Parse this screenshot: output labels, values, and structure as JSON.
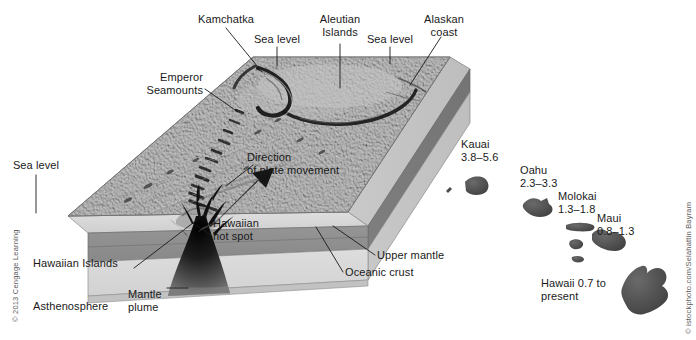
{
  "figure": {
    "background": "#ffffff"
  },
  "colors": {
    "seafloor_top": "#a9a9a9",
    "seafloor_top_light": "#bdbdbd",
    "crust_layer": "#d4d4d4",
    "upper_mantle_layer": "#8e8e8e",
    "asthenosphere_layer": "#d9d9d9",
    "plume": "#1a1a1a",
    "arrow": "#1c1c1c",
    "label_text": "#1a1a1a",
    "leader_line": "#1a1a1a",
    "island": "#4a4a4a",
    "credit_text": "#5b5b5b"
  },
  "labels": {
    "kamchatka": "Kamchatka",
    "sea_level_left_top": "Sea level",
    "aleutian_islands": "Aleutian\nIslands",
    "sea_level_right_top": "Sea level",
    "alaskan_coast": "Alaskan\ncoast",
    "emperor_seamounts": "Emperor\nSeamounts",
    "direction_of_plate_movement": "Direction\nof plate movement",
    "sea_level_left": "Sea level",
    "hawaiian_hot_spot": "Hawaiian\nhot spot",
    "hawaiian_islands": "Hawaiian Islands",
    "asthenosphere": "Asthenosphere",
    "mantle_plume": "Mantle\nplume",
    "upper_mantle": "Upper mantle",
    "oceanic_crust": "Oceanic crust"
  },
  "islands": [
    {
      "name": "Kauai",
      "age_range": "3.8–5.6",
      "label": "Kauai\n3.8–5.6"
    },
    {
      "name": "Oahu",
      "age_range": "2.3–3.3",
      "label": "Oahu\n2.3–3.3"
    },
    {
      "name": "Molokai",
      "age_range": "1.3–1.8",
      "label": "Molokai\n1.3–1.8"
    },
    {
      "name": "Maui",
      "age_range": "0.8–1.3",
      "label": "Maui\n0.8–1.3"
    },
    {
      "name": "Hawaii",
      "age_range": "0.7 to present",
      "label": "Hawaii 0.7 to\npresent"
    }
  ],
  "credits": {
    "left": "© 2013 Cengage Learning",
    "right": "© istockphoto.com/Selahattin Bayram"
  }
}
